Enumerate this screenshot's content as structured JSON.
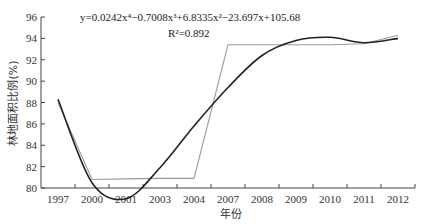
{
  "chart_data": {
    "type": "line",
    "title": "",
    "xlabel": "年份",
    "ylabel": "林地面积比例(%)",
    "ylim": [
      80,
      96
    ],
    "yticks": [
      80,
      82,
      84,
      86,
      88,
      90,
      92,
      94,
      96
    ],
    "categories": [
      "1997",
      "2000",
      "2001",
      "2003",
      "2004",
      "2007",
      "2008",
      "2009",
      "2010",
      "2011",
      "2012"
    ],
    "series": [
      {
        "name": "林地面积比例",
        "style": "gray-polyline",
        "color": "#9a9a9a",
        "values": [
          88.0,
          80.8,
          80.85,
          80.9,
          80.9,
          93.4,
          93.4,
          93.4,
          93.4,
          93.5,
          94.3
        ]
      },
      {
        "name": "多项式趋势线",
        "style": "black-smooth",
        "color": "#222222",
        "values": [
          88.3,
          80.5,
          79.0,
          81.9,
          85.8,
          89.4,
          92.4,
          93.8,
          94.1,
          93.6,
          94.0
        ]
      }
    ],
    "annotations": {
      "equation": "y=0.0242x⁴−0.7008x³+6.8335x²−23.697x+105.68",
      "r_squared": "R²=0.892"
    },
    "grid": false,
    "legend": "none"
  }
}
